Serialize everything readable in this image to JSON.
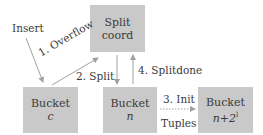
{
  "diagram": {
    "nodes": {
      "split_coord": {
        "line1": "Split",
        "line2": "coord"
      },
      "bucket_c": {
        "line1": "Bucket",
        "line2": "c"
      },
      "bucket_n": {
        "line1": "Bucket",
        "line2": "n"
      },
      "bucket_n2l": {
        "line1": "Bucket",
        "line2_base": "n+2",
        "line2_sup": "l"
      }
    },
    "labels": {
      "insert": "Insert",
      "overflow": "1. Overflow",
      "split": "2. Split",
      "init": "3. Init",
      "tuples": "Tuples",
      "splitdone": "4. Splitdone"
    },
    "colors": {
      "box_fill": "#c9c9c9",
      "arrow": "#a0a0a0",
      "text": "#3a3a3a"
    }
  }
}
